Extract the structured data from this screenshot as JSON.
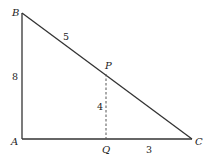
{
  "figure": {
    "type": "right-triangle-diagram",
    "vertices": [
      {
        "id": "A",
        "label": "A",
        "x": 22,
        "y": 139
      },
      {
        "id": "B",
        "label": "B",
        "x": 22,
        "y": 13
      },
      {
        "id": "C",
        "label": "C",
        "x": 192,
        "y": 139
      },
      {
        "id": "P",
        "label": "P",
        "x": 106,
        "y": 72
      },
      {
        "id": "Q",
        "label": "Q",
        "x": 106,
        "y": 139
      }
    ],
    "segments": [
      {
        "from": "A",
        "to": "B",
        "style": "solid",
        "length_label": "8"
      },
      {
        "from": "B",
        "to": "C",
        "style": "solid"
      },
      {
        "from": "A",
        "to": "C",
        "style": "solid"
      },
      {
        "from": "P",
        "to": "Q",
        "style": "dashed",
        "length_label": "4"
      }
    ],
    "length_labels": {
      "BP": "5",
      "AB": "8",
      "PQ": "4",
      "QC": "3"
    }
  }
}
